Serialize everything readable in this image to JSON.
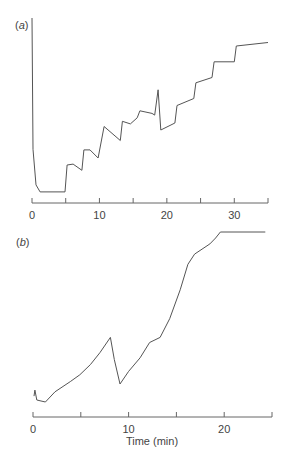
{
  "chart_data": [
    {
      "panel": "(a)",
      "panel_letter": "a",
      "type": "line",
      "title": "",
      "xlabel": "",
      "ylabel": "",
      "xlim": [
        0,
        35
      ],
      "ylim": [
        0,
        100
      ],
      "grid": false,
      "xticks": [
        0,
        5,
        10,
        15,
        20,
        25,
        30,
        35
      ],
      "xtick_labels": [
        "0",
        "",
        "10",
        "",
        "20",
        "",
        "30",
        ""
      ],
      "series": [
        {
          "name": "signal",
          "x": [
            0,
            0.15,
            0.6,
            1.2,
            4.9,
            5.2,
            6.1,
            7.4,
            7.7,
            8.6,
            9.8,
            10.7,
            13.1,
            13.4,
            14.6,
            15.6,
            16.0,
            17.8,
            18.2,
            18.7,
            19.1,
            21.2,
            21.5,
            24.0,
            24.3,
            26.7,
            27.0,
            30.0,
            30.3,
            35.0
          ],
          "y": [
            100,
            25,
            4.6,
            0.6,
            0.6,
            16,
            16.5,
            13,
            24.6,
            24.6,
            20,
            38,
            30,
            41,
            39.5,
            43,
            47,
            45.5,
            44.5,
            59,
            36,
            40,
            50,
            54,
            63,
            66,
            75,
            75,
            84,
            86
          ]
        }
      ]
    },
    {
      "panel": "(b)",
      "panel_letter": "b",
      "type": "line",
      "title": "",
      "xlabel": "Time (min)",
      "ylabel": "",
      "xlim": [
        0,
        25
      ],
      "ylim": [
        0,
        100
      ],
      "grid": false,
      "xticks": [
        0,
        5,
        10,
        15,
        20,
        25
      ],
      "xtick_labels": [
        "0",
        "",
        "10",
        "",
        "20",
        ""
      ],
      "series": [
        {
          "name": "signal",
          "x": [
            0.1,
            0.2,
            0.4,
            1.3,
            2.3,
            3.9,
            4.9,
            6.0,
            7.0,
            8.1,
            8.5,
            9.1,
            10.0,
            11.2,
            12.2,
            13.3,
            14.3,
            15.4,
            16.2,
            16.9,
            18.5,
            19.1,
            19.6,
            24.3
          ],
          "y": [
            3.5,
            7,
            1.2,
            0,
            6,
            12,
            16,
            22,
            29,
            38,
            25,
            10.6,
            18,
            26,
            35,
            38,
            49,
            66,
            81,
            87,
            93,
            96.5,
            100,
            100
          ]
        }
      ]
    }
  ],
  "labels": {
    "panel_a": "a",
    "panel_b": "b",
    "x_axis_title_b": "Time (min)",
    "a_ticks": [
      "0",
      "10",
      "20",
      "30"
    ],
    "b_ticks": [
      "0",
      "10",
      "20"
    ]
  }
}
